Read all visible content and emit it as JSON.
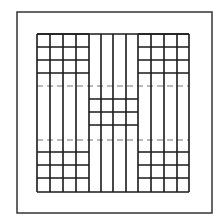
{
  "canvas": {
    "width": 222,
    "height": 223,
    "background": "#ffffff"
  },
  "colors": {
    "line": "#1a1a1a",
    "outer": "#333333",
    "dash": "#777777"
  },
  "outer_box": {
    "x": 17,
    "y": 12,
    "w": 195,
    "h": 201
  },
  "grid": {
    "left": 37,
    "right": 189,
    "top": 34,
    "bottom": 192,
    "columns": [
      37,
      50,
      63,
      76,
      89,
      101,
      113,
      126,
      138,
      151,
      164,
      177,
      189
    ],
    "middle_split": {
      "left": 89,
      "right": 138
    },
    "top_blocks_rows": [
      34,
      47,
      60,
      73
    ],
    "middle_block_rows": [
      99,
      112,
      125
    ],
    "bottom_blocks_rows": [
      152,
      165,
      178
    ],
    "dashed_rows": [
      86,
      140
    ]
  }
}
